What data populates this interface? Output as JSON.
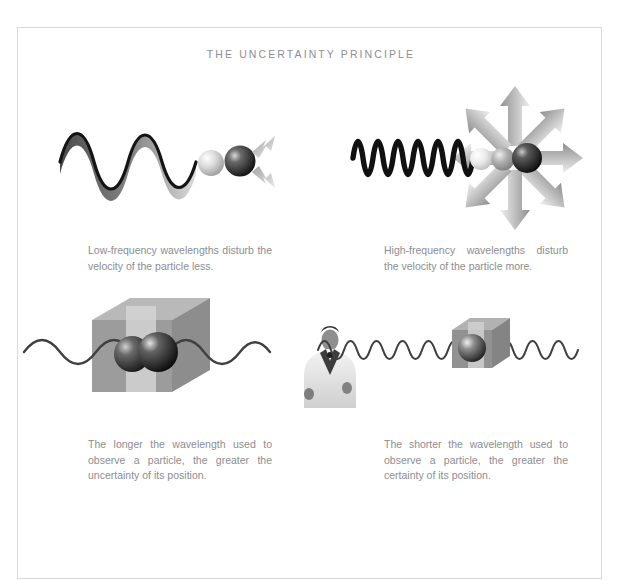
{
  "page": {
    "title": "THE UNCERTAINTY PRINCIPLE",
    "background_color": "#ffffff",
    "frame_color": "#d9d9d9",
    "text_color": "#8d8d90"
  },
  "captions": {
    "low_frequency": "Low-frequency wavelengths disturb the velocity of the particle less.",
    "high_frequency": "High-frequency wavelengths disturb the velocity of the particle more.",
    "longer_wavelength": "The longer the wavelength used to observe a particle, the greater the uncertainty of its position.",
    "shorter_wavelength": "The shorter the wavelength used to observe a particle, the greater the certainty of its position."
  },
  "figures": {
    "low_frequency": {
      "name": "low-frequency-wave-diagram",
      "wave": {
        "cycles": 3,
        "amplitude": 17,
        "stroke": "#1c1c1c"
      },
      "particles": [
        {
          "label": "light-particle",
          "fill": "#cfcfcf"
        },
        {
          "label": "dark-particle",
          "fill": "#2b2b2b"
        }
      ],
      "arrows": {
        "count": 2,
        "color": "#b4b4b4"
      }
    },
    "high_frequency": {
      "name": "high-frequency-wave-diagram",
      "wave": {
        "cycles": 12,
        "amplitude": 20,
        "stroke": "#111111"
      },
      "particles": [
        {
          "label": "light-particle",
          "fill": "#e2e2e2"
        },
        {
          "label": "mid-particle",
          "fill": "#a9a9a9"
        },
        {
          "label": "dark-particle",
          "fill": "#232323"
        }
      ],
      "arrows": {
        "count": 8,
        "color": "#b0b0b0"
      }
    },
    "observation": {
      "name": "observation-wave-diagram",
      "long_wave": {
        "cycles": 4,
        "amplitude": 13,
        "stroke": "#4a4a4a"
      },
      "short_wave": {
        "cycles": 11,
        "amplitude": 11,
        "stroke": "#4a4a4a"
      },
      "large_box": {
        "label": "large-uncertainty-box",
        "face": "#9a9a9a",
        "top": "#b5b5b5",
        "band": "#d2d2d2"
      },
      "small_box": {
        "label": "small-certainty-box",
        "face": "#8f8f8f",
        "top": "#adadad",
        "band": "#d0d0d0"
      },
      "observer": {
        "label": "observer-photo",
        "description": "man in white suit"
      }
    }
  },
  "footer": {
    "watermark_text": " "
  }
}
